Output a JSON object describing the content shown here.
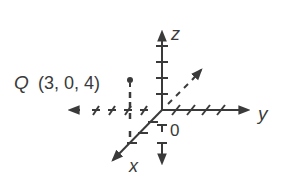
{
  "diagram": {
    "axes": {
      "x_label": "x",
      "y_label": "y",
      "z_label": "z",
      "origin_label": "0"
    },
    "point": {
      "name": "Q",
      "coords_text": "(3, 0, 4)",
      "x": 3,
      "y": 0,
      "z": 4
    },
    "colors": {
      "ink": "#3a3a3a",
      "background": "#ffffff"
    }
  }
}
